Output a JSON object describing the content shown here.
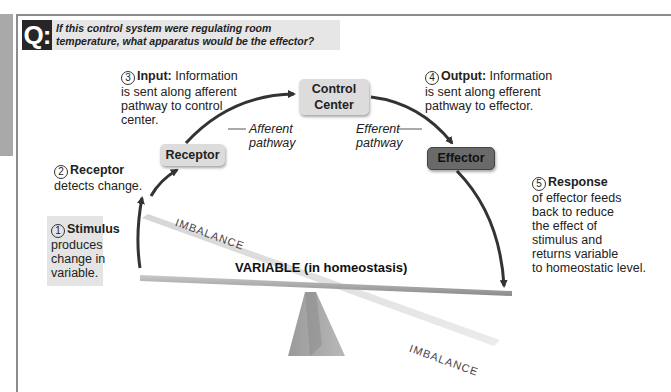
{
  "question": {
    "badge": "Q:",
    "text": "If this control system were regulating room temperature, what apparatus would be the effector?"
  },
  "boxes": {
    "receptor": "Receptor",
    "control_center_line1": "Control",
    "control_center_line2": "Center",
    "effector": "Effector"
  },
  "steps": [
    {
      "num": "1",
      "title": "Stimulus",
      "lines": [
        "produces",
        "change in",
        "variable."
      ]
    },
    {
      "num": "2",
      "title": "Receptor",
      "lines": [
        "detects change."
      ]
    },
    {
      "num": "3",
      "title": "Input:",
      "inline": "Information",
      "lines": [
        "is sent along afferent",
        "pathway to control",
        "center."
      ]
    },
    {
      "num": "4",
      "title": "Output:",
      "inline": "Information",
      "lines": [
        "is sent along efferent",
        "pathway to effector."
      ]
    },
    {
      "num": "5",
      "title": "Response",
      "lines": [
        "of effector feeds",
        "back to reduce",
        "the effect of",
        "stimulus and",
        "returns variable",
        "to homeostatic level."
      ]
    }
  ],
  "pathways": {
    "afferent_line1": "Afferent",
    "afferent_line2": "pathway",
    "efferent_line1": "Efferent",
    "efferent_line2": "pathway"
  },
  "balance": {
    "variable_label": "VARIABLE (in homeostasis)",
    "imbalance_top": "IMBALANCE",
    "imbalance_bottom": "IMBALANCE"
  },
  "colors": {
    "box_light": "#dcdcdc",
    "box_dark": "#6a6a6a",
    "arrow": "#333333",
    "badge": "#262626"
  }
}
